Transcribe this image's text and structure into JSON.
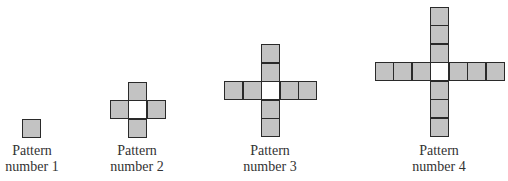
{
  "patterns": [
    {
      "label_line1": "Pattern",
      "label_line2": "number 1",
      "arm_length": 0,
      "center": [
        22,
        119
      ],
      "label_center_x": 32
    },
    {
      "label_line1": "Pattern",
      "label_line2": "number 2",
      "arm_length": 1,
      "center": [
        128,
        100
      ],
      "label_center_x": 137
    },
    {
      "label_line1": "Pattern",
      "label_line2": "number 3",
      "arm_length": 2,
      "center": [
        261,
        81
      ],
      "label_center_x": 270
    },
    {
      "label_line1": "Pattern",
      "label_line2": "number 4",
      "arm_length": 3,
      "center": [
        430,
        62
      ],
      "label_center_x": 439
    }
  ],
  "colors": {
    "fill": "#c3c3c3",
    "center_fill": "#ffffff",
    "border": "#2a2a2a"
  }
}
